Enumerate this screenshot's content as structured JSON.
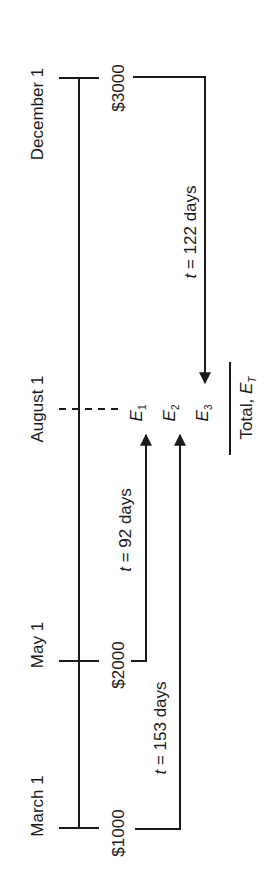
{
  "dates": [
    {
      "label": "December 1",
      "x": 37,
      "y": 114
    },
    {
      "label": "August 1",
      "x": 37,
      "y": 409
    },
    {
      "label": "May 1",
      "x": 37,
      "y": 645
    },
    {
      "label": "March 1",
      "x": 37,
      "y": 806
    }
  ],
  "payments": [
    {
      "label": "$3000",
      "x": 118,
      "y": 88
    },
    {
      "label": "$2000",
      "x": 118,
      "y": 665
    },
    {
      "label": "$1000",
      "x": 118,
      "y": 833
    }
  ],
  "intervals": [
    {
      "t_var": "t",
      "text": " = 122 days",
      "x": 190,
      "y": 232
    },
    {
      "t_var": "t",
      "text": " = 92 days",
      "x": 125,
      "y": 530
    },
    {
      "t_var": "t",
      "text": " = 153 days",
      "x": 160,
      "y": 728
    }
  ],
  "equivalents": [
    {
      "var": "E",
      "sub": "1",
      "x": 138,
      "y": 413
    },
    {
      "var": "E",
      "sub": "2",
      "x": 171,
      "y": 413
    },
    {
      "var": "E",
      "sub": "3",
      "x": 204,
      "y": 413
    }
  ],
  "total": {
    "text": "Total, ",
    "var": "E",
    "sub": "T",
    "x": 248,
    "y": 408
  },
  "colors": {
    "line": "#1a1a1a",
    "background": "#ffffff"
  }
}
